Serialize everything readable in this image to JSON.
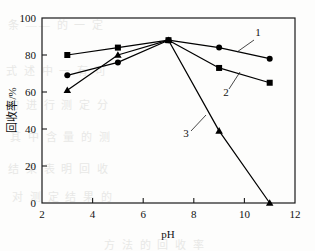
{
  "chart_data": {
    "type": "line",
    "title": "",
    "subtitle": "",
    "xlabel": "pH",
    "ylabel": "回收率/%",
    "xlim": [
      2,
      12
    ],
    "ylim": [
      0,
      100
    ],
    "xticks": [
      "2",
      "4",
      "6",
      "8",
      "10",
      "12"
    ],
    "xtick_values": [
      2,
      4,
      6,
      8,
      10,
      12
    ],
    "yticks": [
      "0",
      "20",
      "40",
      "60",
      "80",
      "100"
    ],
    "ytick_values": [
      0,
      20,
      40,
      60,
      80,
      100
    ],
    "grid": false,
    "legend": "inline-labels",
    "x": [
      3,
      5,
      7,
      9,
      11
    ],
    "series": [
      {
        "name": "1",
        "marker": "circle",
        "color": "#000000",
        "values": [
          69,
          76,
          88,
          84,
          78
        ],
        "label": "1",
        "label_x": 258,
        "label_y": 36,
        "leader_from_x": 254,
        "leader_from_y": 40,
        "leader_to_x": 237,
        "leader_to_y": 52
      },
      {
        "name": "2",
        "marker": "square",
        "color": "#000000",
        "values": [
          80,
          84,
          88,
          73,
          65
        ],
        "label": "2",
        "label_x": 226,
        "label_y": 96,
        "leader_from_x": 229,
        "leader_from_y": 89,
        "leader_to_x": 240,
        "leader_to_y": 72
      },
      {
        "name": "3",
        "marker": "triangle",
        "color": "#000000",
        "values": [
          61,
          80,
          88,
          39,
          0
        ],
        "label": "3",
        "label_x": 186,
        "label_y": 137,
        "leader_from_x": 191,
        "leader_from_y": 131,
        "leader_to_x": 206,
        "leader_to_y": 115
      }
    ]
  },
  "background_bleed": [
    {
      "text": "条 —— 的 一 定",
      "x": 8,
      "y": 16
    },
    {
      "text": "式 述 中 一 有 可",
      "x": 6,
      "y": 62
    },
    {
      "text": "的 进 行 测 定 分",
      "x": 8,
      "y": 96
    },
    {
      "text": "其 中 含 量 的 测",
      "x": 10,
      "y": 128
    },
    {
      "text": "结 果 表 明 回 收",
      "x": 8,
      "y": 160
    },
    {
      "text": "对 测 定 结 果 的",
      "x": 12,
      "y": 188
    },
    {
      "text": "方 法 的 回 收 率",
      "x": 104,
      "y": 236
    }
  ],
  "figure": {
    "frame_left": 42,
    "frame_right": 295,
    "frame_top": 18,
    "frame_bottom": 203
  }
}
